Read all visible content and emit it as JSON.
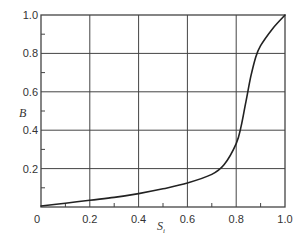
{
  "chart_data": {
    "type": "line",
    "title": "",
    "xlabel": "S",
    "xlabel_subscript": "i",
    "ylabel": "B",
    "xlim": [
      0,
      1.0
    ],
    "ylim": [
      0,
      1.0
    ],
    "grid": true,
    "legend": null,
    "x_ticks": [
      "0",
      "0.2",
      "0.4",
      "0.6",
      "0.8",
      "1.0"
    ],
    "y_ticks": [
      "0.2",
      "0.4",
      "0.6",
      "0.8",
      "1.0"
    ],
    "series": [
      {
        "name": "B vs S",
        "x": [
          0,
          0.1,
          0.2,
          0.3,
          0.4,
          0.5,
          0.6,
          0.7,
          0.75,
          0.8,
          0.82,
          0.84,
          0.86,
          0.88,
          0.9,
          0.95,
          1.0
        ],
        "y": [
          0.005,
          0.02,
          0.035,
          0.05,
          0.07,
          0.095,
          0.125,
          0.17,
          0.22,
          0.33,
          0.42,
          0.55,
          0.68,
          0.78,
          0.84,
          0.93,
          1.0
        ]
      }
    ]
  },
  "colors": {
    "line": "#222222",
    "grid": "#444444",
    "text": "#333333"
  }
}
